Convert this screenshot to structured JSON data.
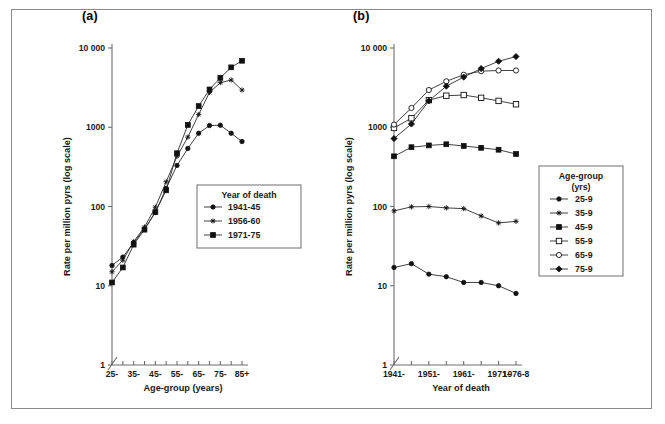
{
  "figure": {
    "background": "#ffffff",
    "frame_color": "#8a8a8a",
    "line_color": "#2b2b2b",
    "marker_color": "#111111"
  },
  "panels": [
    {
      "id": "a",
      "label": "(a)",
      "ylabel": "Rate per million pyrs (log scale)",
      "xlabel": "Age-group (years)",
      "legend_title": "Year of death",
      "legend_title_line2": ""
    },
    {
      "id": "b",
      "label": "(b)",
      "ylabel": "Rate per million pyrs (log scale)",
      "xlabel": "Year of death",
      "legend_title": "Age-group",
      "legend_title_line2": "(yrs)"
    }
  ],
  "chart_data": [
    {
      "type": "line",
      "panel": "(a)",
      "title": "",
      "xlabel": "Age-group (years)",
      "ylabel": "Rate per million pyrs (log scale)",
      "yscale": "log",
      "ylim": [
        1,
        10000
      ],
      "ytick_labels": [
        "10 000",
        "1000",
        "100",
        "10",
        "1"
      ],
      "ytick_values": [
        10000,
        1000,
        100,
        10,
        1
      ],
      "categories": [
        "25-",
        "30-",
        "35-",
        "40-",
        "45-",
        "50-",
        "55-",
        "60-",
        "65-",
        "70-",
        "75-",
        "80-",
        "85+"
      ],
      "xtick_labels": [
        "25-",
        "35-",
        "45-",
        "55-",
        "65-",
        "75-",
        "85+"
      ],
      "xtick_indices": [
        0,
        2,
        4,
        6,
        8,
        10,
        12
      ],
      "axis_break": true,
      "grid": false,
      "legend_position": "inside-lower-right",
      "legend_title": "Year of death",
      "series": [
        {
          "name": "1941-45",
          "marker": "filled-circle",
          "values": [
            18,
            23,
            35,
            52,
            84,
            170,
            330,
            540,
            840,
            1050,
            1060,
            840,
            660,
            380
          ]
        },
        {
          "name": "1956-60",
          "marker": "cross",
          "values": [
            15,
            21,
            36,
            55,
            98,
            205,
            430,
            750,
            1450,
            2750,
            3650,
            3950,
            2950,
            1480
          ]
        },
        {
          "name": "1971-75",
          "marker": "filled-square",
          "values": [
            11,
            17,
            33,
            51,
            85,
            160,
            470,
            1070,
            1850,
            3000,
            4200,
            5700,
            6900,
            6100,
            4400
          ]
        }
      ],
      "series_xindex": {
        "1941-45": [
          0,
          1,
          2,
          3,
          4,
          5,
          6,
          7,
          8,
          9,
          10,
          11,
          12
        ],
        "1956-60": [
          0,
          1,
          2,
          3,
          4,
          5,
          6,
          7,
          8,
          9,
          10,
          11,
          12
        ],
        "1971-75": [
          0,
          1,
          2,
          3,
          4,
          5,
          6,
          7,
          8,
          9,
          10,
          11,
          12
        ]
      }
    },
    {
      "type": "line",
      "panel": "(b)",
      "title": "",
      "xlabel": "Year of death",
      "ylabel": "Rate per million pyrs (log scale)",
      "yscale": "log",
      "ylim": [
        1,
        10000
      ],
      "ytick_labels": [
        "10 000",
        "1000",
        "100",
        "10",
        "1"
      ],
      "ytick_values": [
        10000,
        1000,
        100,
        10,
        1
      ],
      "categories": [
        "1941-",
        "1946-",
        "1951-",
        "1956-",
        "1961-",
        "1966-",
        "1971-",
        "1976-8"
      ],
      "xtick_labels": [
        "1941-",
        "1951-",
        "1961-",
        "1971-",
        "1976-8"
      ],
      "xtick_indices": [
        0,
        2,
        4,
        6,
        7
      ],
      "axis_break": true,
      "grid": false,
      "legend_position": "outside-right",
      "legend_title": "Age-group",
      "legend_title_line2": "(yrs)",
      "series": [
        {
          "name": "25-9",
          "marker": "filled-circle",
          "values": [
            17,
            19,
            14,
            13,
            11,
            11,
            10,
            8
          ]
        },
        {
          "name": "35-9",
          "marker": "cross",
          "values": [
            88,
            99,
            100,
            96,
            94,
            76,
            62,
            65
          ]
        },
        {
          "name": "45-9",
          "marker": "filled-square",
          "values": [
            430,
            560,
            590,
            610,
            580,
            550,
            520,
            460
          ]
        },
        {
          "name": "55-9",
          "marker": "open-square",
          "values": [
            980,
            1300,
            2200,
            2500,
            2550,
            2350,
            2150,
            1950
          ]
        },
        {
          "name": "65-9",
          "marker": "open-circle",
          "values": [
            1080,
            1750,
            2950,
            3800,
            4600,
            5100,
            5200,
            5200
          ]
        },
        {
          "name": "75-9",
          "marker": "filled-diamond",
          "values": [
            720,
            1100,
            2150,
            3300,
            4300,
            5500,
            6800,
            7800
          ]
        }
      ]
    }
  ]
}
